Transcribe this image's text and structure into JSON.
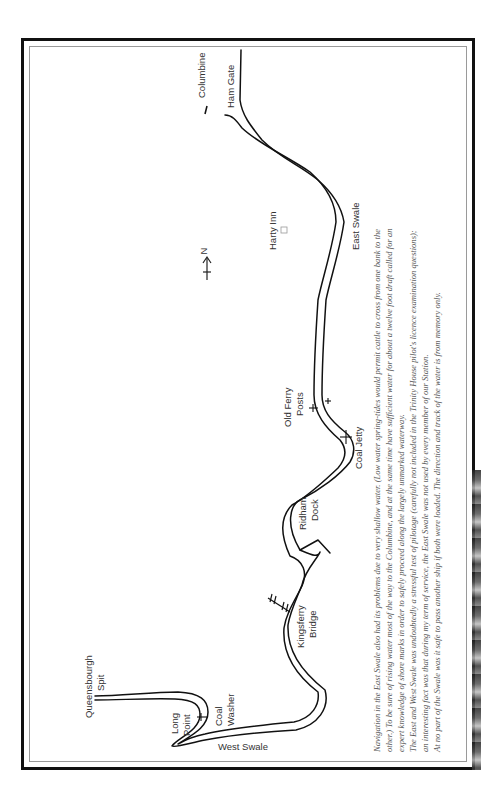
{
  "map": {
    "title": "The Swale",
    "north_label": "N",
    "labels": {
      "columbine": "Columbine",
      "ham_gate": "Ham Gate",
      "east_swale": "East Swale",
      "harty_inn": "Harty Inn",
      "old_ferry_line1": "Old Ferry",
      "old_ferry_line2": "Posts",
      "coal_jetty": "Coal Jetty",
      "ridham_line1": "Ridham",
      "ridham_line2": "Dock",
      "kingsferry_line1": "Kingsferry",
      "kingsferry_line2": "Bridge",
      "queensbourgh_line1": "Queensbourgh",
      "queensbourgh_line2": "Spit",
      "long_point_line1": "Long",
      "long_point_line2": "Point",
      "coal_washer_line1": "Coal",
      "coal_washer_line2": "Washer",
      "west_swale": "West Swale"
    }
  },
  "caption": {
    "lines": [
      "Navigation in the East Swale also had its problems due to very shallow water. (Low water spring-tides would permit cattle to cross from one bank to the",
      "other.) To be sure of rising water most of the way to the Columbine, and at the same time have sufficient water for about a twelve foot draft called for an",
      "expert knowledge of shore marks in order to safely proceed along the largely unmarked waterway.",
      "The East and West Swale was undoubtedly a stressful test of pilotage (carefully not included in the Trinity House pilot's licence examination questions);",
      "an interesting fact was that during my term of service, the East Swale was not used by every member of our Station.",
      "At no part of the Swale was it safe to pass another ship if both were loaded. The direction and track of the water is from memory only."
    ]
  },
  "colors": {
    "ink": "#111111",
    "frame_inner": "#9a9a9a",
    "label_text": "#333333",
    "caption_text": "#555555"
  }
}
